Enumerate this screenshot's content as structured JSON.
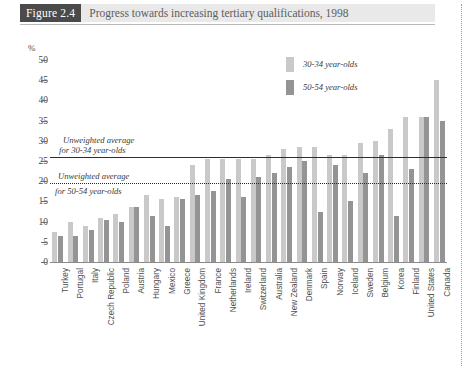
{
  "header": {
    "badge": "Figure 2.4",
    "title": "Progress towards increasing tertiary qualifications, 1998"
  },
  "legend": {
    "items": [
      {
        "label": "30-34 year-olds",
        "color": "#c9c9c9",
        "key": "series_30_34"
      },
      {
        "label": "50-54 year-olds",
        "color": "#949494",
        "key": "series_50_54"
      }
    ]
  },
  "annotations": [
    {
      "id": "avg-30",
      "line1": "Unweighted average",
      "line2": "for 30-34 year-olds",
      "value": 26,
      "style": "solid"
    },
    {
      "id": "avg-50",
      "line1": "Unweighted average",
      "line2": "for 50-54 year-olds",
      "value": 19.5,
      "style": "dotted"
    }
  ],
  "chart_data": {
    "type": "bar",
    "title": "Progress towards increasing tertiary qualifications, 1998",
    "xlabel": "",
    "ylabel": "%",
    "ylim": [
      0,
      50
    ],
    "yticks": [
      0,
      5,
      10,
      15,
      20,
      25,
      30,
      35,
      40,
      45,
      50
    ],
    "grid": false,
    "legend_position": "top-right",
    "categories": [
      "Turkey",
      "Portugal",
      "Italy",
      "Czech Republic",
      "Poland",
      "Austria",
      "Hungary",
      "Mexico",
      "Greece",
      "United Kingdom",
      "France",
      "Netherlands",
      "Ireland",
      "Switzerland",
      "Australia",
      "New Zealand",
      "Denmark",
      "Spain",
      "Norway",
      "Iceland",
      "Sweden",
      "Belgium",
      "Korea",
      "Finland",
      "United States",
      "Canada"
    ],
    "series": [
      {
        "name": "30-34 year-olds",
        "color": "#c9c9c9",
        "values": [
          7.5,
          10,
          9,
          11,
          12,
          13.5,
          16.5,
          15.5,
          16,
          24,
          25.5,
          25.5,
          25.5,
          25.5,
          26.5,
          28,
          28.5,
          28.5,
          26.5,
          26.5,
          29.5,
          30,
          33,
          36,
          36,
          45
        ]
      },
      {
        "name": "50-54 year-olds",
        "color": "#949494",
        "values": [
          6.5,
          6.5,
          8,
          10.5,
          10,
          13.5,
          11.5,
          9,
          15.5,
          16.5,
          17.5,
          20.5,
          16,
          21,
          22,
          23.5,
          25,
          12.5,
          24,
          15,
          22,
          26.5,
          11.5,
          23,
          36,
          35
        ]
      }
    ],
    "annotation_lines": [
      {
        "label": "Unweighted average for 30-34 year-olds",
        "value": 26
      },
      {
        "label": "Unweighted average for 50-54 year-olds",
        "value": 19.5
      }
    ]
  }
}
